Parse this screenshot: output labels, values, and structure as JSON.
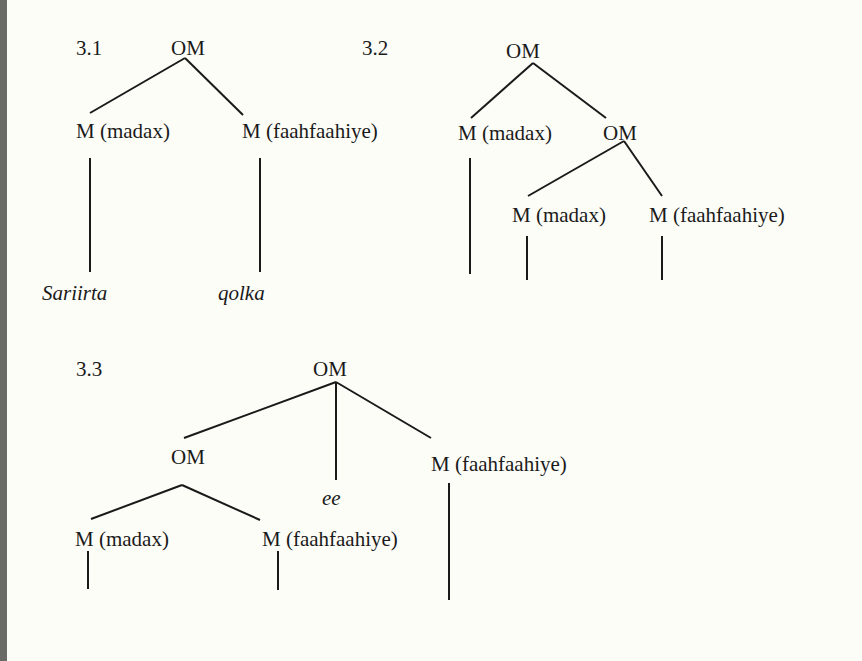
{
  "trees": [
    {
      "label": "3.1",
      "root": "OM",
      "children": [
        {
          "node": "M (madax)",
          "leaf": "Sariirta"
        },
        {
          "node": "M (faahfaahiye)",
          "leaf": "qolka"
        }
      ]
    },
    {
      "label": "3.2",
      "root": "OM",
      "children": [
        {
          "node": "M (madax)"
        },
        {
          "node": "OM",
          "children": [
            {
              "node": "M (madax)"
            },
            {
              "node": "M (faahfaahiye)"
            }
          ]
        }
      ]
    },
    {
      "label": "3.3",
      "root": "OM",
      "children": [
        {
          "node": "OM",
          "children": [
            {
              "node": "M (madax)"
            },
            {
              "node": "M (faahfaahiye)"
            }
          ]
        },
        {
          "node": "ee"
        },
        {
          "node": "M (faahfaahiye)"
        }
      ]
    }
  ]
}
